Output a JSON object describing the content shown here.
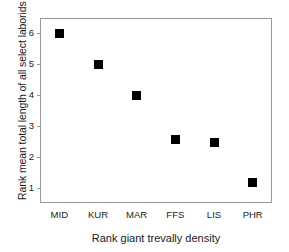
{
  "chart_data": {
    "type": "scatter",
    "title": "",
    "xlabel": "Rank giant trevally density",
    "ylabel": "Rank mean total length of all select laborids",
    "categories": [
      "MID",
      "KUR",
      "MAR",
      "FFS",
      "LIS",
      "PHR"
    ],
    "values": [
      6,
      5,
      4,
      2.55,
      2.45,
      1.15
    ],
    "points": [
      {
        "x": "MID",
        "y": 6
      },
      {
        "x": "KUR",
        "y": 5
      },
      {
        "x": "MAR",
        "y": 4
      },
      {
        "x": "FFS",
        "y": 2.55
      },
      {
        "x": "LIS",
        "y": 2.45
      },
      {
        "x": "PHR",
        "y": 1.15
      }
    ],
    "yticks": [
      1,
      2,
      3,
      4,
      5,
      6
    ],
    "ytick_labels": [
      "1",
      "2",
      "3",
      "4",
      "5",
      "6"
    ],
    "xtick_labels": [
      "MID",
      "KUR",
      "MAR",
      "FFS",
      "LIS",
      "PHR"
    ],
    "ylim": [
      0.5,
      6.5
    ],
    "grid": false,
    "legend": null,
    "marker_style": "filled-square",
    "marker_color": "#000000",
    "frame_color": "#9a9a9a",
    "background_color": "#ffffff",
    "text_color": "#1a1a1a"
  }
}
